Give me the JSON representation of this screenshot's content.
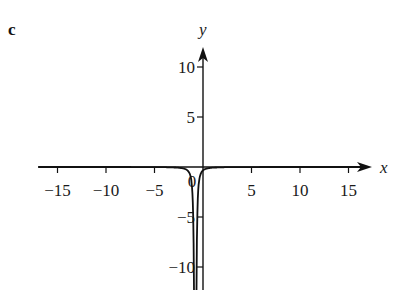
{
  "panel_label": "c",
  "chart_data": {
    "type": "line",
    "title": "",
    "panel": "c",
    "xlabel": "x",
    "ylabel": "y",
    "xlim": [
      -17,
      17
    ],
    "ylim": [
      -13,
      12
    ],
    "grid": false,
    "legend": null,
    "x_ticks": [
      -15,
      -10,
      -5,
      5,
      10,
      15
    ],
    "x_tick_labels": [
      "−15",
      "−10",
      "−5",
      "5",
      "10",
      "15"
    ],
    "y_ticks": [
      10,
      5,
      -5,
      -10
    ],
    "y_tick_labels": [
      "10",
      "5",
      "−5",
      "−10"
    ],
    "origin_label": "0",
    "annotations": [
      "vertical asymptote near x ≈ −0.8; curve approaches y = 0 as x → ±∞ and y → −∞ near the asymptote"
    ],
    "series": [
      {
        "name": "curve",
        "color": "#111111",
        "x": [
          -17,
          -10,
          -5,
          -3,
          -2,
          -1.5,
          -1.2,
          -1.05,
          -0.95,
          -0.55,
          -0.45,
          -0.3,
          0,
          0.5,
          1,
          2,
          5,
          10,
          17
        ],
        "y": [
          -0.003,
          -0.01,
          -0.05,
          -0.2,
          -0.6,
          -2,
          -6,
          -13,
          -13,
          -13,
          -6,
          -2.5,
          -0.8,
          -0.3,
          -0.15,
          -0.05,
          -0.01,
          -0.003,
          -0.001
        ]
      }
    ]
  },
  "colors": {
    "background": "#ffffff",
    "ink": "#111111"
  }
}
